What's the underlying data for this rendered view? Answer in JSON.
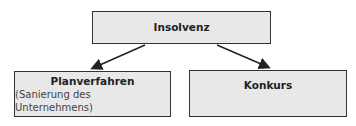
{
  "diagram": {
    "root": {
      "label": "Insolvenz"
    },
    "children": [
      {
        "label": "Planverfahren",
        "sublabel": "(Sanierung des Unternehmens)"
      },
      {
        "label": "Konkurs"
      }
    ],
    "colors": {
      "box_fill": "#e8e8e8",
      "border": "#333333",
      "arrow": "#222222"
    }
  }
}
